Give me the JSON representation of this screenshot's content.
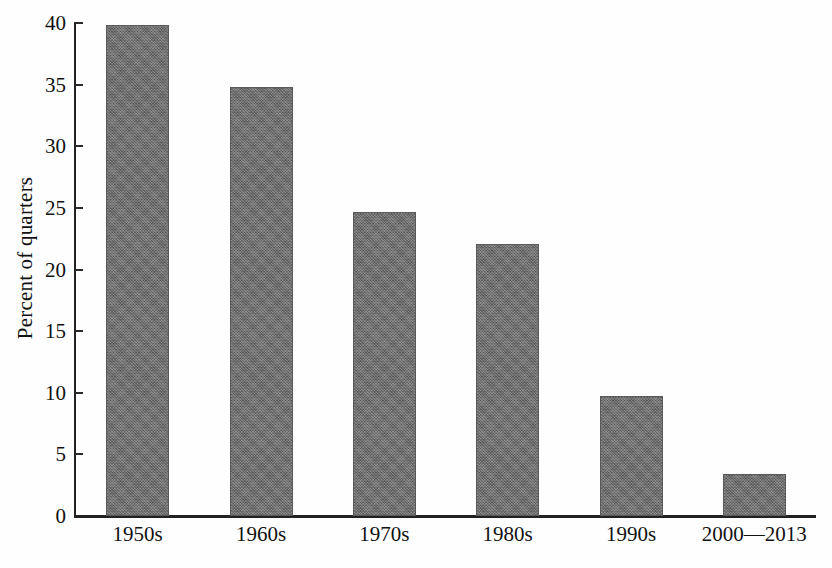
{
  "chart_data": {
    "type": "bar",
    "title": "",
    "subtitle": "",
    "xlabel": "",
    "ylabel": "Percent of quarters",
    "categories": [
      "1950s",
      "1960s",
      "1970s",
      "1980s",
      "1990s",
      "2000—2013"
    ],
    "values": [
      39.8,
      34.8,
      24.7,
      22.1,
      9.7,
      3.4
    ],
    "series": [
      {
        "name": "Percent of quarters",
        "values": [
          39.8,
          34.8,
          24.7,
          22.1,
          9.7,
          3.4
        ]
      }
    ],
    "ylim": [
      0,
      40
    ],
    "yticks": [
      0,
      5,
      10,
      15,
      20,
      25,
      30,
      35,
      40
    ],
    "ytick_labels": [
      "0",
      "5",
      "10",
      "15",
      "20",
      "25",
      "30",
      "35",
      "40"
    ],
    "grid": false,
    "legend": false,
    "legend_position": "none",
    "bar_color": "#6e6e6e",
    "axis_color": "#222222",
    "background_color": "#ffffff",
    "annotations": []
  },
  "figure": {
    "caption_fragment": ""
  }
}
